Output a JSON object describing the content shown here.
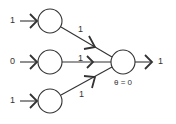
{
  "diagram": {
    "inputs": [
      {
        "value": "1",
        "weight": "1"
      },
      {
        "value": "0",
        "weight": "1"
      },
      {
        "value": "1",
        "weight": "1"
      }
    ],
    "output": {
      "value": "1",
      "threshold_label": "θ = 0"
    },
    "colors": {
      "stroke": "#333333",
      "background": "#ffffff"
    }
  }
}
